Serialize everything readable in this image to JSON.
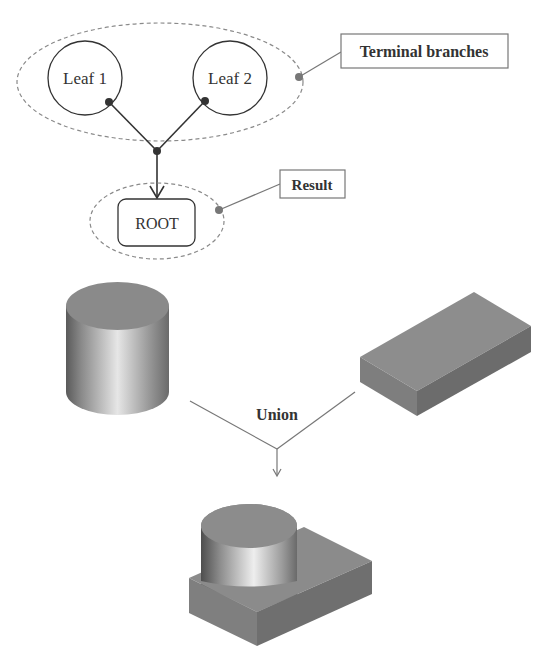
{
  "tree": {
    "leaf1": "Leaf 1",
    "leaf2": "Leaf 2",
    "root": "ROOT"
  },
  "callouts": {
    "terminal_branches": "Terminal branches",
    "result": "Result"
  },
  "operation": {
    "label": "Union"
  },
  "colors": {
    "line": "#333333",
    "dashed": "#888888",
    "callout_line": "#777777",
    "solid_gray": "#7a7a7a"
  }
}
